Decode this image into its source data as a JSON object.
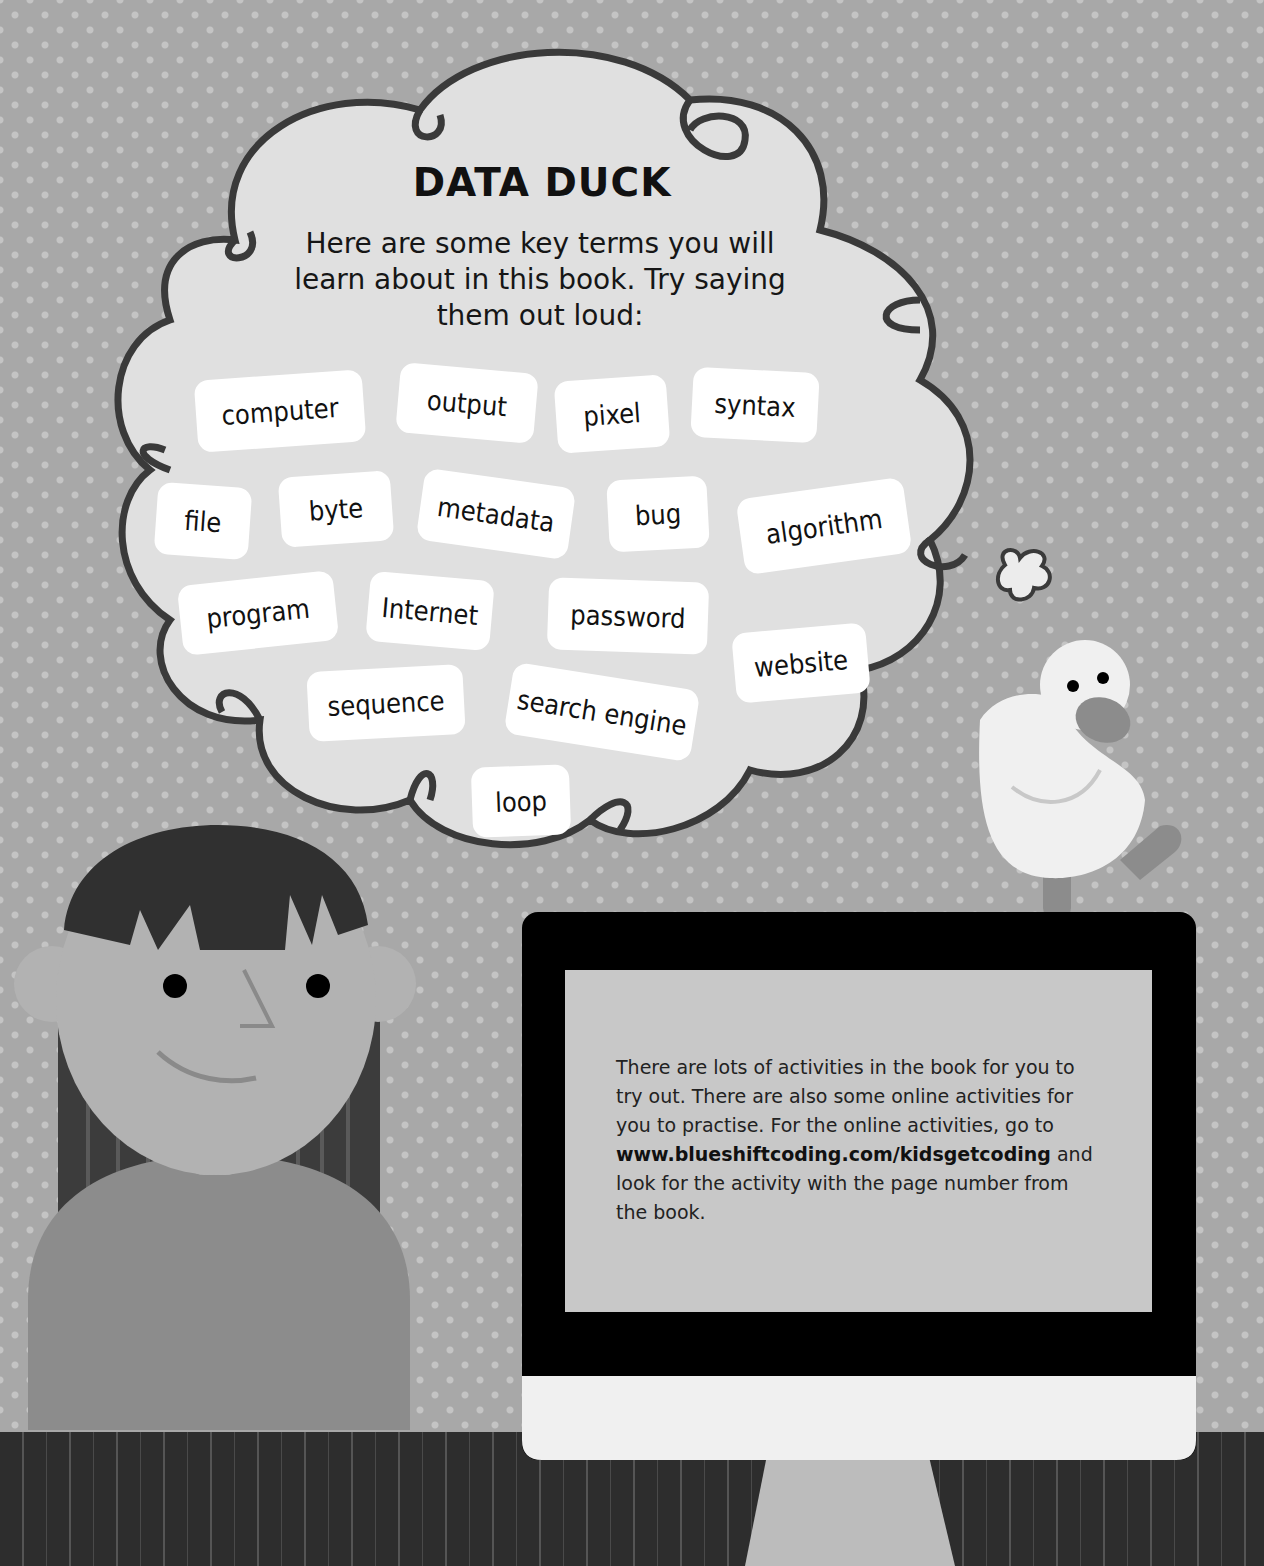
{
  "bubble": {
    "title": "DATA DUCK",
    "intro": "Here are some key terms you will learn about in this book. Try saying them out loud:",
    "terms": [
      {
        "label": "computer",
        "x": 196,
        "y": 375,
        "w": 168,
        "h": 72,
        "rot": -4
      },
      {
        "label": "output",
        "x": 398,
        "y": 368,
        "w": 138,
        "h": 70,
        "rot": 5
      },
      {
        "label": "pixel",
        "x": 556,
        "y": 378,
        "w": 112,
        "h": 72,
        "rot": -4
      },
      {
        "label": "syntax",
        "x": 692,
        "y": 370,
        "w": 126,
        "h": 70,
        "rot": 3
      },
      {
        "label": "file",
        "x": 156,
        "y": 485,
        "w": 94,
        "h": 72,
        "rot": 4
      },
      {
        "label": "byte",
        "x": 280,
        "y": 474,
        "w": 112,
        "h": 70,
        "rot": -4
      },
      {
        "label": "metadata",
        "x": 420,
        "y": 478,
        "w": 152,
        "h": 72,
        "rot": 8
      },
      {
        "label": "bug",
        "x": 608,
        "y": 478,
        "w": 100,
        "h": 72,
        "rot": -3
      },
      {
        "label": "algorithm",
        "x": 740,
        "y": 488,
        "w": 168,
        "h": 76,
        "rot": -8
      },
      {
        "label": "program",
        "x": 180,
        "y": 578,
        "w": 156,
        "h": 70,
        "rot": -6
      },
      {
        "label": "Internet",
        "x": 368,
        "y": 576,
        "w": 124,
        "h": 70,
        "rot": 5
      },
      {
        "label": "password",
        "x": 548,
        "y": 580,
        "w": 160,
        "h": 72,
        "rot": 2
      },
      {
        "label": "website",
        "x": 734,
        "y": 628,
        "w": 134,
        "h": 70,
        "rot": -5
      },
      {
        "label": "sequence",
        "x": 308,
        "y": 668,
        "w": 156,
        "h": 70,
        "rot": -3
      },
      {
        "label": "search engine",
        "x": 508,
        "y": 676,
        "w": 188,
        "h": 72,
        "rot": 9
      },
      {
        "label": "loop",
        "x": 472,
        "y": 766,
        "w": 98,
        "h": 70,
        "rot": -2
      }
    ]
  },
  "monitor": {
    "text_before": "There are lots of activities in the book for you to try out. There are also some online activities for you to practise. For the online activities, go to ",
    "link": "www.blueshiftcoding.com/kidsgetcoding",
    "text_after": " and look for the activity with the page number from the book."
  },
  "colors": {
    "wall": "#a8a8a8",
    "bubble": "#e0e0e0",
    "outline": "#3a3a3a",
    "monitor_bezel": "#000000",
    "screen": "#c8c8c8",
    "chin": "#f0f0f0",
    "floor": "#2d2d2d"
  }
}
